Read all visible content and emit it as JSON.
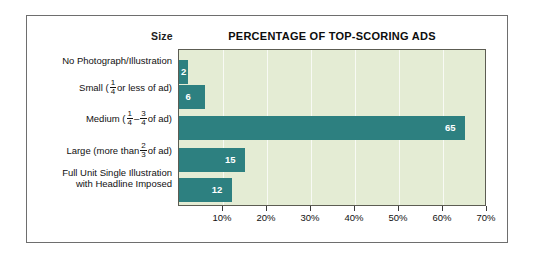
{
  "figure": {
    "size_header": "Size",
    "title": "PERCENTAGE OF TOP-SCORING ADS"
  },
  "colors": {
    "bar": "#2d8080",
    "plot_background": "#e4ecd4",
    "frame_border": "#6e6e6e",
    "value_label": "#ffffff"
  },
  "chart_data": {
    "type": "bar",
    "orientation": "horizontal",
    "title": "PERCENTAGE OF TOP-SCORING ADS",
    "xlabel": "",
    "ylabel": "Size",
    "xlim": [
      0,
      70
    ],
    "grid": true,
    "legend": "none",
    "categories": [
      "No Photograph/Illustration",
      "Small (1/4 or less of ad)",
      "Medium (1/4 – 3/4 of ad)",
      "Large (more than 2/3 of ad)",
      "Full Unit Single Illustration with Headline Imposed"
    ],
    "values": [
      2,
      6,
      65,
      15,
      12
    ],
    "value_labels": [
      "2",
      "6",
      "65",
      "15",
      "12"
    ],
    "tick_values": [
      10,
      20,
      30,
      40,
      50,
      60,
      70
    ],
    "tick_labels": [
      "10%",
      "20%",
      "30%",
      "40%",
      "50%",
      "60%",
      "70%"
    ]
  },
  "categories": [
    {
      "id": "no-photograph",
      "label_plain": "No Photograph/Illustration",
      "prefix": "No Photograph/Illustration",
      "suffix": "",
      "value": "2"
    },
    {
      "id": "small",
      "label_plain": "Small (1/4 or less of ad)",
      "prefix": "Small (",
      "num1": "1",
      "den1": "4",
      "mid": "or less of ad)",
      "suffix": "",
      "value": "6"
    },
    {
      "id": "medium",
      "label_plain": "Medium (1/4 – 3/4 of ad)",
      "prefix": "Medium (",
      "num1": "1",
      "den1": "4",
      "mid": "–",
      "num2": "3",
      "den2": "4",
      "suffix": "of ad)",
      "value": "65"
    },
    {
      "id": "large",
      "label_plain": "Large (more than 2/3 of ad)",
      "prefix": "Large (more than",
      "num1": "2",
      "den1": "3",
      "suffix": "of ad)",
      "value": "15"
    },
    {
      "id": "full-unit",
      "label_plain": "Full Unit Single Illustration with Headline Imposed",
      "line1": "Full Unit Single Illustration",
      "line2": "with Headline Imposed",
      "value": "12"
    }
  ],
  "axis": {
    "labels": [
      "10%",
      "20%",
      "30%",
      "40%",
      "50%",
      "60%",
      "70%"
    ]
  }
}
